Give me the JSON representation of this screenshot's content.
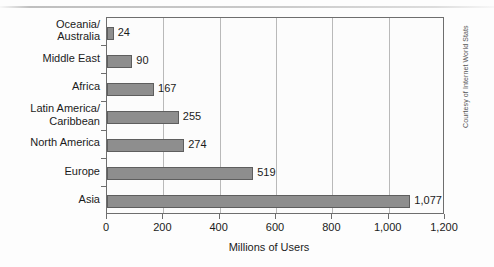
{
  "chart_data": {
    "type": "bar",
    "orientation": "horizontal",
    "title": "",
    "xlabel": "Millions of Users",
    "ylabel": "",
    "categories": [
      "Oceania/\nAustralia",
      "Middle East",
      "Africa",
      "Latin America/\nCaribbean",
      "North America",
      "Europe",
      "Asia"
    ],
    "values": [
      24,
      90,
      167,
      255,
      274,
      519,
      1077
    ],
    "value_labels": [
      "24",
      "90",
      "167",
      "255",
      "274",
      "519",
      "1,077"
    ],
    "xlim": [
      0,
      1200
    ],
    "xticks": [
      0,
      200,
      400,
      600,
      800,
      1000,
      1200
    ],
    "xtick_labels": [
      "0",
      "200",
      "400",
      "600",
      "800",
      "1,000",
      "1,200"
    ],
    "grid": true,
    "legend": false,
    "bar_color": "#8e8e8e",
    "bar_border_color": "#5e5e5e",
    "axis_color": "#6e6e6e",
    "gridline_color": "#b9b9b9"
  },
  "credit": {
    "text": "Courtesy of Internet World Stats"
  }
}
